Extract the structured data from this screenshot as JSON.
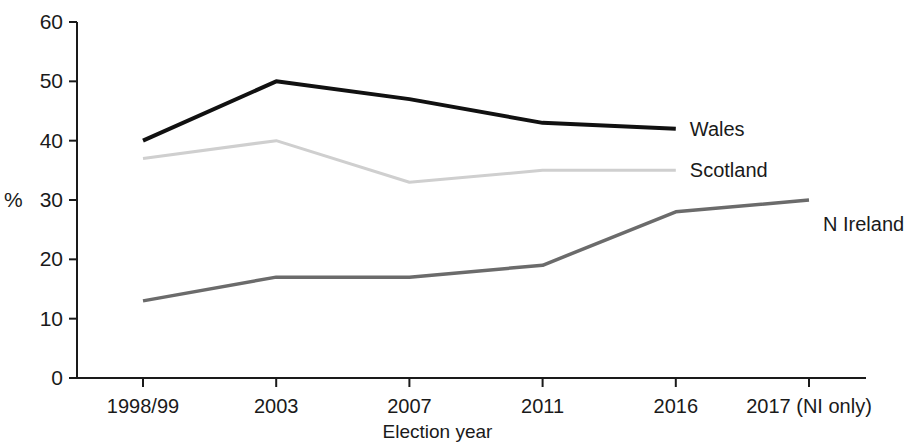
{
  "chart_data": {
    "type": "line",
    "title": "",
    "subtitle": "",
    "xlabel": "Election year",
    "ylabel": "%",
    "categories": [
      "1998/99",
      "2003",
      "2007",
      "2011",
      "2016",
      "2017 (NI only)"
    ],
    "ylim": [
      0,
      60
    ],
    "yticks": [
      0,
      10,
      20,
      30,
      40,
      50,
      60
    ],
    "ytick_labels": [
      "0",
      "10",
      "20",
      "30",
      "40",
      "50",
      "60"
    ],
    "grid": false,
    "legend_position": "right-inline-labels",
    "series": [
      {
        "name": "Wales",
        "color": "#111111",
        "line_width": 4,
        "values": [
          40,
          50,
          47,
          43,
          42,
          null
        ],
        "label_x_category": "2017 (NI only)",
        "label_y_value": 42
      },
      {
        "name": "Scotland",
        "color": "#cfcfcf",
        "line_width": 3,
        "values": [
          37,
          40,
          33,
          35,
          35,
          null
        ],
        "label_x_category": "2017 (NI only)",
        "label_y_value": 35
      },
      {
        "name": "N Ireland",
        "color": "#6b6b6b",
        "line_width": 3.5,
        "values": [
          13,
          17,
          17,
          19,
          28,
          30
        ],
        "label_x_category": "2017 (NI only)",
        "label_y_value": 26
      }
    ],
    "axis_color": "#1a1a1a",
    "background_color": "#ffffff"
  },
  "labels": {
    "y_axis_title": "%",
    "x_axis_title": "Election year",
    "series_wales": "Wales",
    "series_scotland": "Scotland",
    "series_n_ireland": "N Ireland"
  }
}
